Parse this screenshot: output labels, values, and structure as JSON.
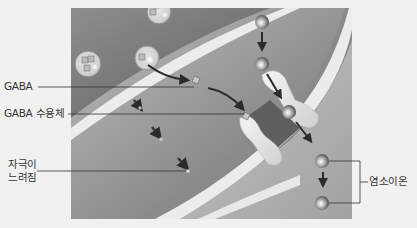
{
  "diagram": {
    "type": "GABA synapse inhibitory mechanism",
    "labels": {
      "gaba": "GABA",
      "gaba_receptor": "GABA 수용체",
      "stimulus_line1": "자극이",
      "stimulus_line2": "느려짐",
      "chloride_ion": "염소이온"
    },
    "colors": {
      "background": "#f1f1f1",
      "panel_dark": "#7d7d7d",
      "panel_light": "#b5b5b5",
      "membrane": "#ececec",
      "ion": "#8a8a8a",
      "arrow": "#2b2b2b",
      "leader_line": "#333333"
    }
  }
}
